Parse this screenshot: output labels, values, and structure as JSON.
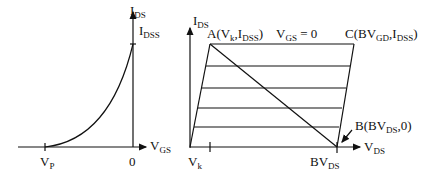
{
  "left_plot": {
    "y_axis_label": {
      "main": "I",
      "sub": "DS"
    },
    "y_peak_label": {
      "main": "I",
      "sub": "DSS"
    },
    "x_axis_label": {
      "main": "V",
      "sub": "GS"
    },
    "pinch_label": {
      "main": "V",
      "sub": "P"
    },
    "origin_label": "0"
  },
  "right_plot": {
    "y_axis_label": {
      "main": "I",
      "sub": "DS"
    },
    "x_axis_label": {
      "main": "V",
      "sub": "DS"
    },
    "point_a": {
      "pre": "A(V",
      "sub1": "k",
      "mid": ",I",
      "sub2": "DSS",
      "post": ")"
    },
    "vgs_label": {
      "main": "V",
      "sub": "GS",
      "post": " = 0"
    },
    "point_c": {
      "pre": "C(BV",
      "sub1": "GD",
      "mid": ",I",
      "sub2": "DSS",
      "post": ")"
    },
    "point_b": {
      "pre": "B(BV",
      "sub1": "DS",
      "post": ",0)"
    },
    "vk_label": {
      "main": "V",
      "sub": "k"
    },
    "bvds_label": {
      "main": "BV",
      "sub": "DS"
    }
  }
}
